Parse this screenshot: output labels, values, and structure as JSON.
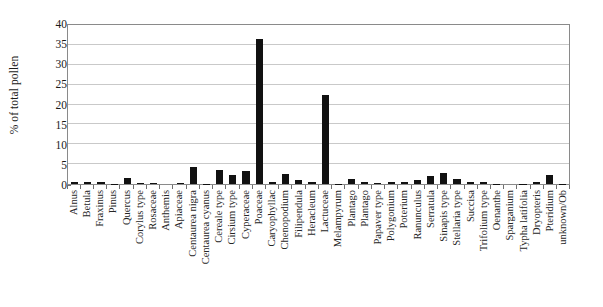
{
  "chart_data": {
    "type": "bar",
    "title": "",
    "xlabel": "",
    "ylabel": "% of total pollen",
    "ylim": [
      0,
      40
    ],
    "yticks": [
      0,
      5,
      10,
      15,
      20,
      25,
      30,
      35,
      40
    ],
    "grid": true,
    "legend": null,
    "bar_color": "#111111",
    "categories": [
      "Alnus",
      "Betula",
      "Fraxinus",
      "Pinus",
      "Quercus",
      "Corylus type",
      "Rosaceae",
      "Anthemis",
      "Apiaceae",
      "Centaurea nigra",
      "Centaurea cyanus",
      "Cereale type",
      "Cirsium type",
      "Cyperaceae",
      "Poaceae",
      "Caryophyllac",
      "Chenopodium",
      "Filipendula",
      "Heracleum",
      "Lactuceae",
      "Melampyrum",
      "Plantago",
      "Plantago",
      "Papaver type",
      "Polygonium",
      "Poterium",
      "Ranunculus",
      "Serratula",
      "Sinapis type",
      "Stellaria type",
      "Succisa",
      "Trifolium type",
      "Oenanthe",
      "Sparganium",
      "Typha latifolia",
      "Dryopteris",
      "Pteridium",
      "unknown/Ob"
    ],
    "values": [
      0.4,
      0.4,
      0.4,
      0.1,
      1.5,
      0.3,
      0.3,
      0.0,
      0.3,
      4.3,
      0.1,
      3.5,
      2.2,
      3.3,
      36.5,
      0.4,
      2.5,
      1.0,
      0.4,
      22.5,
      0.1,
      1.3,
      0.6,
      0.3,
      0.4,
      0.5,
      1.0,
      2.0,
      2.7,
      1.3,
      0.4,
      0.4,
      0.1,
      0.0,
      0.1,
      0.5,
      2.2,
      0.1
    ]
  }
}
